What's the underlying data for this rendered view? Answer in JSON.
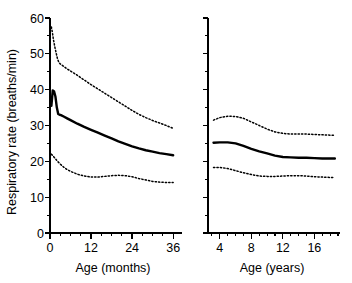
{
  "figure": {
    "background": "#ffffff",
    "ink_color": "#000000",
    "y_axis_label": "Respiratory rate (breaths/min)",
    "y_ticks": [
      0,
      10,
      20,
      30,
      40,
      50,
      60
    ],
    "y_minor_step": 5,
    "y_limits": [
      0,
      60
    ]
  },
  "chart_data": [
    {
      "type": "line",
      "panel": "left",
      "title": "",
      "xlabel": "Age (months)",
      "ylabel": "Respiratory rate (breaths/min)",
      "xlim": [
        0,
        38
      ],
      "ylim": [
        0,
        60
      ],
      "xticks": [
        0,
        12,
        24,
        36
      ],
      "xtick_labels": [
        "0",
        "12",
        "24",
        "36"
      ],
      "x_minor_step": 3,
      "yticks": [
        0,
        10,
        20,
        30,
        40,
        50,
        60
      ],
      "ytick_labels": [
        "0",
        "10",
        "20",
        "30",
        "40",
        "50",
        "60"
      ],
      "y_minor_step": 5,
      "grid": false,
      "legend": "none",
      "series": [
        {
          "name": "Upper centile",
          "style": "dotted",
          "x": [
            0.4,
            0.7,
            1.0,
            1.4,
            1.8,
            2.2,
            2.6,
            3.0,
            4,
            5,
            6,
            8,
            10,
            12,
            14,
            16,
            18,
            20,
            22,
            24,
            26,
            28,
            30,
            32,
            34,
            36
          ],
          "values": [
            57.5,
            56.0,
            54.0,
            52.0,
            50.2,
            48.6,
            47.6,
            47.2,
            46.5,
            45.8,
            45.2,
            44.0,
            42.7,
            41.4,
            40.2,
            39.0,
            37.8,
            36.6,
            35.4,
            34.2,
            33.1,
            32.2,
            31.4,
            30.7,
            30.0,
            29.2
          ]
        },
        {
          "name": "Median",
          "style": "solid",
          "x": [
            0.4,
            0.8,
            1.2,
            1.6,
            2.0,
            2.4,
            2.8,
            3.2,
            4,
            5,
            6,
            8,
            10,
            12,
            14,
            16,
            18,
            20,
            22,
            24,
            26,
            28,
            30,
            32,
            34,
            36
          ],
          "values": [
            35.5,
            39.8,
            39.5,
            38.0,
            35.0,
            33.2,
            33.0,
            32.9,
            32.5,
            32.0,
            31.5,
            30.5,
            29.6,
            28.8,
            28.0,
            27.2,
            26.4,
            25.6,
            24.9,
            24.2,
            23.6,
            23.1,
            22.7,
            22.3,
            22.0,
            21.7
          ]
        },
        {
          "name": "Lower centile",
          "style": "dotted",
          "x": [
            0.4,
            1.0,
            1.6,
            2.2,
            2.8,
            3.5,
            4,
            5,
            6,
            8,
            10,
            12,
            14,
            16,
            18,
            20,
            22,
            24,
            26,
            28,
            30,
            32,
            34,
            36
          ],
          "values": [
            22.0,
            21.4,
            20.7,
            20.0,
            19.4,
            18.8,
            18.4,
            17.7,
            17.2,
            16.4,
            15.9,
            15.6,
            15.6,
            15.8,
            16.0,
            16.1,
            16.0,
            15.7,
            15.2,
            14.8,
            14.4,
            14.2,
            14.1,
            14.1
          ]
        }
      ]
    },
    {
      "type": "line",
      "panel": "right",
      "title": "",
      "xlabel": "Age (years)",
      "ylabel": "Respiratory rate (breaths/min)",
      "xlim": [
        2.5,
        19
      ],
      "ylim": [
        0,
        60
      ],
      "xticks": [
        4,
        8,
        12,
        16
      ],
      "xtick_labels": [
        "4",
        "8",
        "12",
        "16"
      ],
      "x_minor_step": 1,
      "yticks": [
        0,
        10,
        20,
        30,
        40,
        50,
        60
      ],
      "ytick_labels": [
        "",
        "",
        "",
        "",
        "",
        "",
        ""
      ],
      "y_minor_step": 5,
      "grid": false,
      "legend": "none",
      "series": [
        {
          "name": "Upper centile",
          "style": "dotted",
          "x": [
            3.2,
            4,
            5,
            6,
            7,
            8,
            9,
            10,
            11,
            12,
            13,
            14,
            15,
            16,
            17,
            18,
            18.6
          ],
          "values": [
            31.5,
            32.2,
            32.6,
            32.5,
            32.0,
            31.0,
            30.0,
            29.0,
            28.2,
            27.8,
            27.6,
            27.6,
            27.6,
            27.5,
            27.4,
            27.3,
            27.3
          ]
        },
        {
          "name": "Median",
          "style": "solid",
          "x": [
            3.2,
            4,
            5,
            6,
            7,
            8,
            9,
            10,
            11,
            12,
            13,
            14,
            15,
            16,
            17,
            18,
            18.6
          ],
          "values": [
            25.2,
            25.3,
            25.3,
            25.0,
            24.3,
            23.5,
            22.8,
            22.2,
            21.6,
            21.2,
            21.1,
            21.0,
            21.0,
            20.9,
            20.8,
            20.8,
            20.8
          ]
        },
        {
          "name": "Lower centile",
          "style": "dotted",
          "x": [
            3.2,
            4,
            5,
            6,
            7,
            8,
            9,
            10,
            11,
            12,
            13,
            14,
            15,
            16,
            17,
            18,
            18.6
          ],
          "values": [
            18.3,
            18.3,
            18.0,
            17.4,
            16.8,
            16.3,
            15.9,
            15.8,
            15.8,
            15.9,
            16.0,
            16.0,
            15.9,
            15.7,
            15.6,
            15.5,
            15.5
          ]
        }
      ]
    }
  ]
}
